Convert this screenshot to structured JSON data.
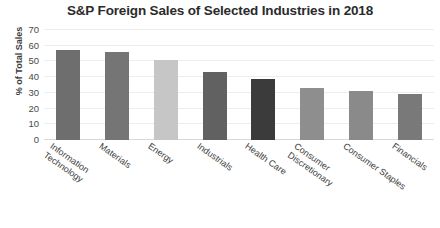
{
  "chart_data": {
    "type": "bar",
    "title": "S&P Foreign Sales of Selected Industries in 2018",
    "xlabel": "",
    "ylabel": "% of Total Sales",
    "ylim": [
      0,
      70
    ],
    "yticks": [
      0,
      10,
      20,
      30,
      40,
      50,
      60,
      70
    ],
    "grid": true,
    "legend": "none",
    "categories": [
      "Information Technology",
      "Materials",
      "Energy",
      "Industrials",
      "Health Care",
      "Consumer Discretionary",
      "Consumer Staples",
      "Financials"
    ],
    "category_lines": [
      [
        "Information",
        "Technology"
      ],
      [
        "Materials"
      ],
      [
        "Energy"
      ],
      [
        "Industrials"
      ],
      [
        "Health Care"
      ],
      [
        "Consumer",
        "Discretionary"
      ],
      [
        "Consumer Staples"
      ],
      [
        "Financials"
      ]
    ],
    "values": [
      57,
      56,
      51,
      43,
      39,
      33,
      31,
      29
    ],
    "bar_colors": [
      "#6e6e6e",
      "#757575",
      "#c6c6c6",
      "#616161",
      "#3b3b3b",
      "#8e8e8e",
      "#8a8a8a",
      "#797979"
    ]
  },
  "style": {
    "background": "#ffffff",
    "gridline_color": "#ededed",
    "baseline_color": "#d8d8d8",
    "text_color": "#3d3d3d",
    "title_color": "#2b2b2b"
  }
}
